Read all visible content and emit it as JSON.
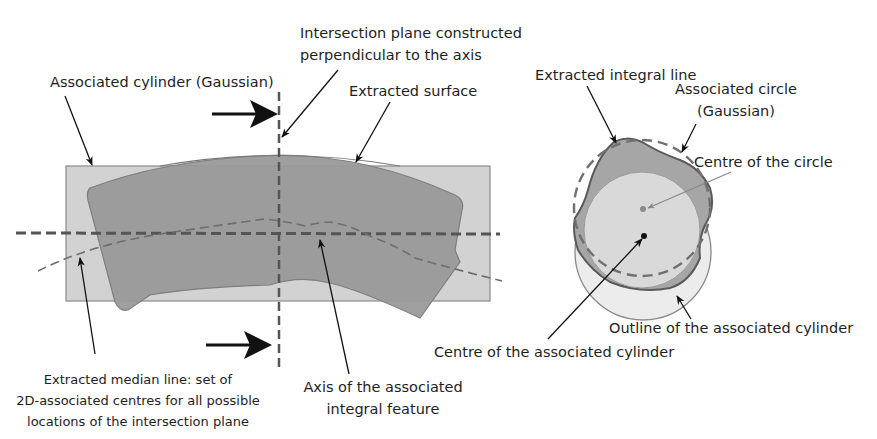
{
  "diagram": {
    "type": "technical-illustration",
    "colors": {
      "background": "#ffffff",
      "associated_cylinder_fill": "#d2d2d2",
      "associated_cylinder_stroke": "#8a8a8a",
      "extracted_surface_fill": "#9a9a9a",
      "extracted_surface_stroke": "#7a7a7a",
      "axis_dash": "#555555",
      "median_line_dash": "#6e6e6e",
      "arrow": "#111111",
      "circle_fill": "#d9d9d9",
      "extracted_profile_fill": "#a6a6a6"
    },
    "left_view": {
      "labels": {
        "associated_cylinder": "Associated cylinder (Gaussian)",
        "intersection_plane_line1": "Intersection plane constructed",
        "intersection_plane_line2": "perpendicular to the axis",
        "extracted_surface": "Extracted surface",
        "median_line_line1": "Extracted median line: set of",
        "median_line_line2": "2D-associated centres for all possible",
        "median_line_line3": "locations  of the intersection plane",
        "axis_line1": "Axis of the associated",
        "axis_line2": "integral feature"
      }
    },
    "right_view": {
      "labels": {
        "extracted_integral_line": "Extracted integral line",
        "associated_circle_line1": "Associated circle",
        "associated_circle_line2": "(Gaussian)",
        "centre_of_circle": "Centre of the circle",
        "outline_cylinder": "Outline of the associated cylinder",
        "centre_cylinder": "Centre of the associated cylinder"
      }
    }
  }
}
